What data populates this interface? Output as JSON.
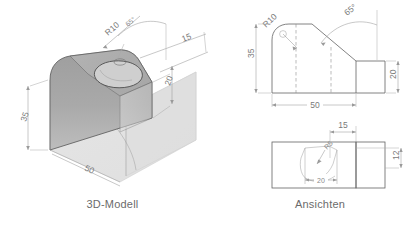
{
  "document": {
    "background_color": "#ffffff",
    "line_color": "#636363",
    "dimension_color": "#7a7a7a",
    "shade_light": "#d8d8d8",
    "shade_mid": "#b5b5b5",
    "shade_dark": "#8f8f8f"
  },
  "model_panel": {
    "caption": "3D-Modell",
    "dimensions": [
      {
        "id": "radius_top",
        "label": "R10",
        "note": "rounded top edge radius"
      },
      {
        "id": "angle_top",
        "label": "65°",
        "note": "chamfer angle"
      },
      {
        "id": "pocket_width",
        "label": "15",
        "note": "pocket width from right face"
      },
      {
        "id": "height_right",
        "label": "20",
        "note": "height of right step"
      },
      {
        "id": "height_left",
        "label": "35",
        "note": "overall height"
      },
      {
        "id": "length",
        "label": "50",
        "note": "overall length"
      }
    ]
  },
  "views_panel": {
    "caption": "Ansichten",
    "front_view": {
      "name": "Vorderansicht",
      "dimensions": [
        {
          "id": "fv-radius",
          "label": "R10"
        },
        {
          "id": "fv-angle",
          "label": "65°"
        },
        {
          "id": "fv-height",
          "label": "35"
        },
        {
          "id": "fv-step-height",
          "label": "20"
        },
        {
          "id": "fv-length",
          "label": "50"
        }
      ]
    },
    "top_view": {
      "name": "Draufsicht",
      "dimensions": [
        {
          "id": "tv-offset",
          "label": "15"
        },
        {
          "id": "tv-depth",
          "label": "12"
        },
        {
          "id": "tv-pocket",
          "label": "20"
        },
        {
          "id": "tv-radius",
          "label": "R5"
        }
      ]
    }
  }
}
